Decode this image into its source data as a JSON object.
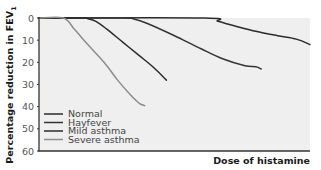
{
  "chart_data": {
    "type": "line",
    "title": "",
    "xlabel": "Dose of histamine",
    "ylabel": "Percentage reduction in FEV",
    "ylabel_subscript": "1",
    "ylim": [
      0,
      60
    ],
    "y_inverted": true,
    "yticks": [
      0,
      10,
      20,
      30,
      40,
      50,
      60
    ],
    "x_ticks_shown": false,
    "grid": false,
    "legend_position": "lower-left inside plot",
    "x_domain": [
      0,
      100
    ],
    "series": [
      {
        "name": "Normal",
        "color": "#2b2b2b",
        "points": [
          [
            0,
            0
          ],
          [
            61,
            0
          ],
          [
            66,
            1.5
          ],
          [
            72,
            3.5
          ],
          [
            80,
            6
          ],
          [
            88,
            8
          ],
          [
            95,
            9.5
          ],
          [
            100,
            12
          ]
        ]
      },
      {
        "name": "Hayfever",
        "color": "#333333",
        "points": [
          [
            0,
            0
          ],
          [
            31,
            0
          ],
          [
            35,
            0.5
          ],
          [
            40,
            2.5
          ],
          [
            50,
            8
          ],
          [
            60,
            14
          ],
          [
            68,
            18.5
          ],
          [
            76,
            21.5
          ],
          [
            80,
            22
          ],
          [
            82,
            23
          ]
        ]
      },
      {
        "name": "Mild asthma",
        "color": "#2b2b2b",
        "points": [
          [
            0,
            0
          ],
          [
            16,
            0
          ],
          [
            18,
            0.3
          ],
          [
            21,
            1.5
          ],
          [
            25,
            5
          ],
          [
            31,
            11
          ],
          [
            37,
            17
          ],
          [
            42,
            22
          ],
          [
            47,
            28
          ]
        ]
      },
      {
        "name": "Severe asthma",
        "color": "#8c8c8c",
        "points": [
          [
            0,
            0
          ],
          [
            9,
            0
          ],
          [
            13,
            5
          ],
          [
            18,
            12
          ],
          [
            24,
            20
          ],
          [
            29,
            28
          ],
          [
            34,
            35
          ],
          [
            37,
            38.5
          ],
          [
            39,
            39.5
          ]
        ]
      }
    ]
  },
  "legend": {
    "items": [
      {
        "label": "Normal",
        "color": "#2b2b2b"
      },
      {
        "label": "Hayfever",
        "color": "#333333"
      },
      {
        "label": "Mild asthma",
        "color": "#2b2b2b"
      },
      {
        "label": "Severe asthma",
        "color": "#8c8c8c"
      }
    ]
  },
  "axes": {
    "y_title": "Percentage reduction in FEV",
    "y_title_sub": "1",
    "x_title": "Dose of histamine",
    "yticks": [
      "0",
      "10",
      "20",
      "30",
      "40",
      "50",
      "60"
    ]
  },
  "colors": {
    "plot_background": "#efefef",
    "axis": "#333333"
  }
}
